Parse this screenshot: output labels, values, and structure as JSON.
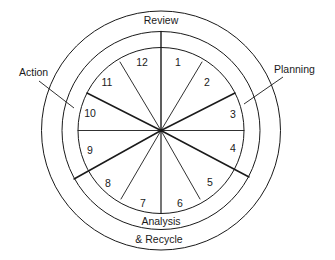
{
  "diagram": {
    "type": "cycle-wheel",
    "center": [
      161,
      130
    ],
    "radii": {
      "outer": 119,
      "middle": 100,
      "inner": 83
    },
    "stroke_color": "#1a1a1a",
    "segments": [
      {
        "number": "1",
        "pos": [
          178,
          66
        ]
      },
      {
        "number": "2",
        "pos": [
          207,
          86
        ]
      },
      {
        "number": "3",
        "pos": [
          233,
          118
        ]
      },
      {
        "number": "4",
        "pos": [
          233,
          152
        ]
      },
      {
        "number": "5",
        "pos": [
          210,
          186
        ]
      },
      {
        "number": "6",
        "pos": [
          180,
          207
        ]
      },
      {
        "number": "7",
        "pos": [
          143,
          207
        ]
      },
      {
        "number": "8",
        "pos": [
          108,
          187
        ]
      },
      {
        "number": "9",
        "pos": [
          90,
          154
        ]
      },
      {
        "number": "10",
        "pos": [
          90,
          117
        ]
      },
      {
        "number": "11",
        "pos": [
          107,
          86
        ]
      },
      {
        "number": "12",
        "pos": [
          142,
          66
        ]
      }
    ],
    "phases": {
      "review": "Review",
      "planning": "Planning",
      "action": "Action",
      "analysis_line1": "Analysis",
      "analysis_line2": "& Recycle"
    }
  }
}
